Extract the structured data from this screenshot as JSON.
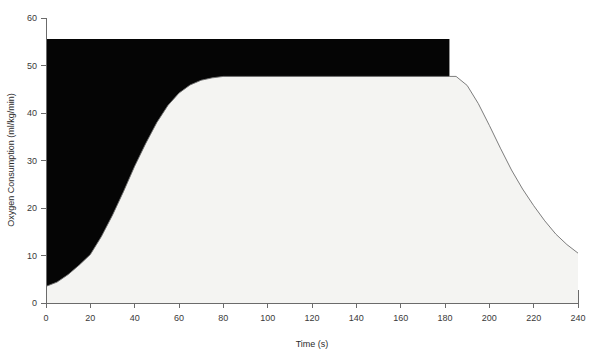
{
  "chart_data": {
    "type": "area",
    "title": "",
    "xlabel": "Time (s)",
    "ylabel": "Oxygen Consumption (ml/kg/min)",
    "xlim": [
      0,
      240
    ],
    "ylim": [
      0,
      60
    ],
    "xticks": [
      0,
      20,
      40,
      60,
      80,
      100,
      120,
      140,
      160,
      180,
      200,
      220,
      240
    ],
    "yticks": [
      0,
      10,
      20,
      30,
      40,
      50,
      60
    ],
    "grid": false,
    "legend": "none",
    "colors": {
      "oxygen_deficit_fill": "#050505",
      "oxygen_uptake_fill": "#f4f4f2",
      "curve_outline": "#6e6e6e",
      "axis": "#6b6b6b",
      "text": "#2b2b2b"
    },
    "series": [
      {
        "name": "Oxygen Consumption (VO2)",
        "x": [
          0,
          5,
          10,
          15,
          20,
          25,
          30,
          35,
          40,
          45,
          50,
          55,
          60,
          65,
          70,
          75,
          80,
          90,
          100,
          110,
          120,
          130,
          140,
          150,
          160,
          170,
          180,
          182,
          185,
          190,
          195,
          200,
          205,
          210,
          215,
          220,
          225,
          230,
          235,
          240
        ],
        "y": [
          3.5,
          4.4,
          6.0,
          8.0,
          10.2,
          14.0,
          18.5,
          23.5,
          28.8,
          33.6,
          38.0,
          41.6,
          44.2,
          45.9,
          46.9,
          47.4,
          47.7,
          47.7,
          47.7,
          47.7,
          47.7,
          47.7,
          47.7,
          47.7,
          47.7,
          47.7,
          47.7,
          47.7,
          47.7,
          45.8,
          42.0,
          37.4,
          32.6,
          28.0,
          24.0,
          20.5,
          17.3,
          14.5,
          12.3,
          10.5
        ]
      },
      {
        "name": "Steady-state demand (VO2 required)",
        "x": [
          0,
          182
        ],
        "y": [
          55.6,
          55.6
        ]
      }
    ],
    "regions": [
      {
        "name": "oxygen-deficit-region",
        "description": "Black filled area between the steady-state demand line and the rising VO2 curve, from t=0 to t=182 s",
        "fill": "#050505"
      },
      {
        "name": "oxygen-consumed-region",
        "description": "Light filled area under the VO2 curve across the full time range",
        "fill": "#f4f4f2"
      }
    ],
    "annotations": []
  },
  "axes": {
    "y_tick_labels": [
      "0",
      "10",
      "20",
      "30",
      "40",
      "50",
      "60"
    ],
    "x_tick_labels": [
      "0",
      "20",
      "40",
      "60",
      "80",
      "100",
      "120",
      "140",
      "160",
      "180",
      "200",
      "220",
      "240"
    ],
    "x_axis_title": "Time (s)",
    "y_axis_title": "Oxygen Consumption (ml/kg/min)"
  }
}
